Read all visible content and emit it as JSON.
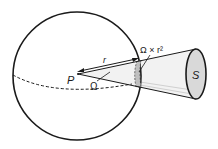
{
  "diagram": {
    "labels": {
      "point": "P",
      "radius": "r",
      "solid_angle": "Ω",
      "area_on_sphere": "Ω × r²",
      "surface": "S"
    },
    "colors": {
      "stroke": "#1a1a1a",
      "surface_fill": "#d9d9d9",
      "cone_fill": "#f2f2f2",
      "patch_fill": "#bfbfbf"
    }
  }
}
